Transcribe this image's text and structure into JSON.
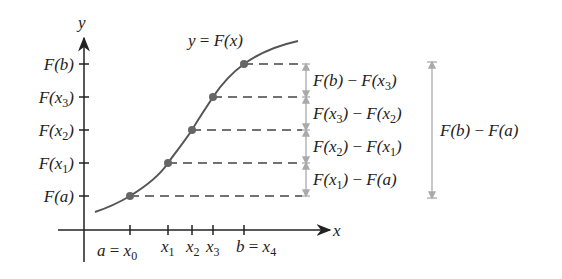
{
  "axes": {
    "x_label": "x",
    "y_label": "y"
  },
  "curve_label": "y = F(x)",
  "y_ticks": [
    {
      "id": "b",
      "text": "F(b)",
      "y": 64
    },
    {
      "id": "x3",
      "text": "F(x3)",
      "y": 97
    },
    {
      "id": "x2",
      "text": "F(x2)",
      "y": 130
    },
    {
      "id": "x1",
      "text": "F(x1)",
      "y": 163
    },
    {
      "id": "a",
      "text": "F(a)",
      "y": 196
    }
  ],
  "x_ticks": [
    {
      "text": "a = x0",
      "x": 130
    },
    {
      "text": "x1",
      "x": 168
    },
    {
      "text": "x2",
      "x": 192
    },
    {
      "text": "x3",
      "x": 213
    },
    {
      "text": "b = x4",
      "x": 244
    }
  ],
  "differences": [
    "F(b) − F(x3)",
    "F(x3) − F(x2)",
    "F(x2) − F(x1)",
    "F(x1) − F(a)"
  ],
  "total_difference": "F(b) − F(a)",
  "colors": {
    "curve": "#555555",
    "axis": "#222222",
    "bracket": "#aaaaaa",
    "point": "#666666"
  }
}
